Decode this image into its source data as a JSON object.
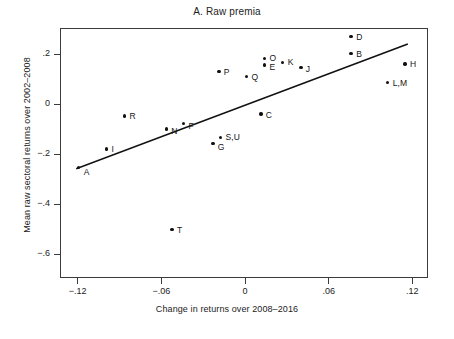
{
  "chart_data": {
    "type": "scatter",
    "title": "A. Raw premia",
    "xlabel": "Change in returns over 2008–2016",
    "ylabel": "Mean raw sectoral returns over 2002–2008",
    "xlim": [
      -0.132,
      0.1305
    ],
    "ylim": [
      -0.6909,
      0.3
    ],
    "xticks": [
      -0.12,
      -0.06,
      0,
      0.06,
      0.12
    ],
    "xticklabels": [
      "−.12",
      "−.06",
      "0",
      ".06",
      ".12"
    ],
    "yticks": [
      0.2,
      0,
      -0.2,
      -0.4,
      -0.6
    ],
    "yticklabels": [
      ".2",
      "0",
      "−.2",
      "−.4",
      "−.6"
    ],
    "grid": false,
    "legend": null,
    "marker": "filled-circle",
    "marker_color": "#111111",
    "fit_line": {
      "color": "#111111",
      "width": 1.6,
      "x_start": -0.1206,
      "y_start": -0.2577,
      "x_end": 0.1162,
      "y_end": 0.2385
    },
    "points": [
      {
        "label": "A",
        "x": -0.1193,
        "y": -0.2545,
        "label_dx": 5,
        "label_dy": 4
      },
      {
        "label": "I",
        "x": -0.0994,
        "y": -0.18,
        "label_dx": 5,
        "label_dy": 0
      },
      {
        "label": "R",
        "x": -0.0864,
        "y": -0.0473,
        "label_dx": 5,
        "label_dy": 0
      },
      {
        "label": "N",
        "x": -0.0565,
        "y": -0.1,
        "label_dx": 5,
        "label_dy": 2
      },
      {
        "label": "F",
        "x": -0.0441,
        "y": -0.0782,
        "label_dx": 5,
        "label_dy": 2
      },
      {
        "label": "T",
        "x": -0.0523,
        "y": -0.5018,
        "label_dx": 5,
        "label_dy": 0
      },
      {
        "label": "G",
        "x": -0.0231,
        "y": -0.1564,
        "label_dx": 5,
        "label_dy": 4
      },
      {
        "label": "S,U",
        "x": -0.0176,
        "y": -0.1345,
        "label_dx": 5,
        "label_dy": -1
      },
      {
        "label": "P",
        "x": -0.0188,
        "y": 0.1291,
        "label_dx": 5,
        "label_dy": 0
      },
      {
        "label": "Q",
        "x": 0.001,
        "y": 0.1109,
        "label_dx": 5,
        "label_dy": 1
      },
      {
        "label": "C",
        "x": 0.0113,
        "y": -0.04,
        "label_dx": 5,
        "label_dy": 1
      },
      {
        "label": "O",
        "x": 0.014,
        "y": 0.1818,
        "label_dx": 5,
        "label_dy": -1
      },
      {
        "label": "E",
        "x": 0.014,
        "y": 0.1564,
        "label_dx": 5,
        "label_dy": 2
      },
      {
        "label": "K",
        "x": 0.027,
        "y": 0.1673,
        "label_dx": 5,
        "label_dy": 0
      },
      {
        "label": "J",
        "x": 0.04,
        "y": 0.1455,
        "label_dx": 5,
        "label_dy": 1
      },
      {
        "label": "D",
        "x": 0.0761,
        "y": 0.2691,
        "label_dx": 5,
        "label_dy": 0
      },
      {
        "label": "B",
        "x": 0.0761,
        "y": 0.2018,
        "label_dx": 5,
        "label_dy": 0
      },
      {
        "label": "L,M",
        "x": 0.1023,
        "y": 0.0873,
        "label_dx": 5,
        "label_dy": 1
      },
      {
        "label": "H",
        "x": 0.1147,
        "y": 0.16,
        "label_dx": 5,
        "label_dy": 0
      }
    ]
  }
}
